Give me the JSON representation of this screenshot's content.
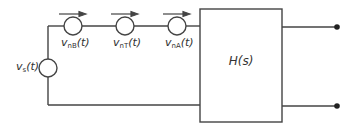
{
  "diagram": {
    "source": {
      "label_main": "v",
      "label_sub": "s",
      "label_arg": "(t)"
    },
    "noise_sources": [
      {
        "label_main": "v",
        "label_sub": "nB",
        "label_arg": "(t)"
      },
      {
        "label_main": "v",
        "label_sub": "nT",
        "label_arg": "(t)"
      },
      {
        "label_main": "v",
        "label_sub": "nA",
        "label_arg": "(t)"
      }
    ],
    "block": {
      "label": "H(s)"
    },
    "colors": {
      "line": "#444444",
      "text": "#333333"
    }
  }
}
